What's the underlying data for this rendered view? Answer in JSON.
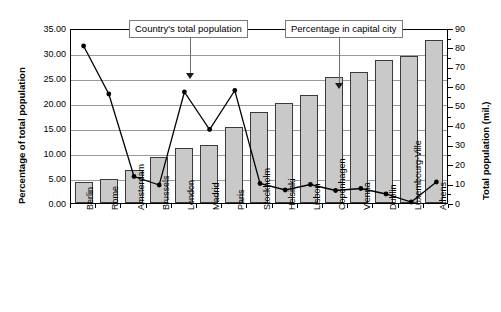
{
  "chart_data": {
    "type": "bar",
    "title": "",
    "categories": [
      "Berlin",
      "Rome",
      "Amsterdam",
      "Brussels",
      "London",
      "Madrid",
      "Paris",
      "Stockholm",
      "Helsinki",
      "Lisbon",
      "Copenhagen",
      "Vienna",
      "Dublin",
      "Luxembourg-Ville",
      "Athens"
    ],
    "series": [
      {
        "name": "Country's total population",
        "axis": "right",
        "type": "bar",
        "unit": "mil.",
        "values": [
          11.0,
          12.5,
          17.0,
          23.5,
          28.5,
          30.0,
          39.0,
          47.0,
          51.5,
          55.5,
          65.0,
          67.5,
          73.5,
          75.5,
          84.0
        ]
      },
      {
        "name": "Percentage in capital city",
        "axis": "left",
        "type": "line",
        "unit": "%",
        "values": [
          31.8,
          22.2,
          5.7,
          4.0,
          22.6,
          15.1,
          22.9,
          4.3,
          3.0,
          4.1,
          2.9,
          3.3,
          2.2,
          0.6,
          4.6
        ]
      }
    ],
    "xlabel": "",
    "ylabel": "Percentage of total population",
    "y2label": "Total population (mil.)",
    "ylim": [
      0,
      35
    ],
    "y2lim": [
      0,
      90
    ],
    "yticks": [
      "0.00",
      "5.00",
      "10.00",
      "15.00",
      "20.00",
      "25.00",
      "30.00",
      "35.00"
    ],
    "y2ticks": [
      "0",
      "10",
      "20",
      "30",
      "40",
      "50",
      "60",
      "70",
      "80",
      "90"
    ],
    "grid": true,
    "legend": "none",
    "annotations": [
      {
        "label": "Country's total population",
        "points_to": "London",
        "style": "box-with-arrow"
      },
      {
        "label": "Percentage in capital city",
        "points_to": "Lisbon",
        "style": "box-with-arrow"
      }
    ]
  },
  "axes": {
    "left_title": "Percentage of total population",
    "right_title": "Total population (mil.)"
  },
  "callouts": {
    "bar_series": "Country's total population",
    "line_series": "Percentage in capital city"
  },
  "colors": {
    "bar_fill": "#c9c9c9",
    "bar_stroke": "#3a3a3a",
    "line": "#000000",
    "grid": "#9a9a9a",
    "callout_border": "#7a7a7a"
  }
}
